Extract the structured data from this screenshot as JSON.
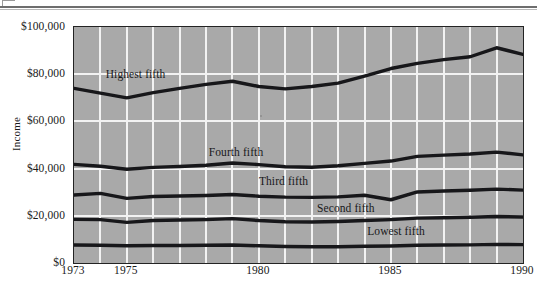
{
  "chart_data": {
    "type": "line",
    "title": "",
    "subtitle": "",
    "xlabel": "",
    "ylabel": "Income",
    "xlim": [
      1973,
      1990
    ],
    "ylim": [
      0,
      100000
    ],
    "grid": true,
    "legend_position": "inline-labels",
    "x": [
      1973,
      1974,
      1975,
      1976,
      1977,
      1978,
      1979,
      1980,
      1981,
      1982,
      1983,
      1984,
      1985,
      1986,
      1987,
      1988,
      1989,
      1990
    ],
    "x_tick_labels": [
      "1973",
      "1975",
      "1980",
      "1985",
      "1990"
    ],
    "x_tick_values": [
      1973,
      1975,
      1980,
      1985,
      1990
    ],
    "y_tick_labels": [
      "$0",
      "$20,000",
      "$40,000",
      "$60,000",
      "$80,000",
      "$100,000"
    ],
    "y_tick_values": [
      0,
      20000,
      40000,
      60000,
      80000,
      100000
    ],
    "series": [
      {
        "name": "Highest fifth",
        "label": "Highest fifth",
        "label_x": 1974.2,
        "label_y": 79500,
        "values": [
          74000,
          72000,
          70000,
          72200,
          74000,
          75700,
          77000,
          74800,
          73800,
          74800,
          76200,
          79200,
          82400,
          84600,
          86200,
          87400,
          91200,
          88400
        ]
      },
      {
        "name": "Fourth fifth",
        "label": "Fourth fifth",
        "label_x": 1978.1,
        "label_y": 46800,
        "values": [
          41800,
          41000,
          39700,
          40500,
          40900,
          41400,
          42400,
          41700,
          40800,
          40600,
          41200,
          42200,
          43200,
          45200,
          45700,
          46200,
          47000,
          45800
        ]
      },
      {
        "name": "Third fifth",
        "label": "Third fifth",
        "label_x": 1980.0,
        "label_y": 34200,
        "values": [
          28800,
          29500,
          27400,
          28200,
          28400,
          28600,
          29000,
          28300,
          27900,
          27800,
          28000,
          28700,
          26800,
          30100,
          30500,
          30800,
          31300,
          30900
        ]
      },
      {
        "name": "Second fifth",
        "label": "Second fifth",
        "label_x": 1982.2,
        "label_y": 22700,
        "values": [
          18500,
          18400,
          17200,
          18000,
          18200,
          18400,
          18800,
          18000,
          17500,
          17400,
          17600,
          18000,
          18400,
          19000,
          19200,
          19400,
          19700,
          19500
        ]
      },
      {
        "name": "Lowest fifth",
        "label": "Lowest fifth",
        "label_x": 1984.1,
        "label_y": 13200,
        "values": [
          7600,
          7500,
          7300,
          7400,
          7400,
          7500,
          7600,
          7300,
          7000,
          6900,
          6900,
          7100,
          7200,
          7500,
          7600,
          7700,
          7900,
          7800
        ]
      }
    ],
    "colors": {
      "plot_background": "#a9a9a9",
      "gridline": "#f2f2f2",
      "line": "#17171a",
      "axis": "#232323",
      "page_background": "#ffffff",
      "rule": "#6e6e6e"
    }
  }
}
